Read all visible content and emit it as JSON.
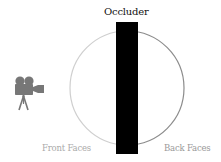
{
  "labels": {
    "occluder": "Occluder",
    "front_faces": "Front Faces",
    "back_faces": "Back Faces"
  },
  "icons": {
    "camera": "movie-camera-icon"
  },
  "colors": {
    "background": "#ffffff",
    "occluder": "#000000",
    "front_arc": "#cfcfcf",
    "back_arc": "#8c8c8c",
    "camera": "#777777",
    "front_label": "#aaaaaa",
    "back_label": "#999999"
  }
}
